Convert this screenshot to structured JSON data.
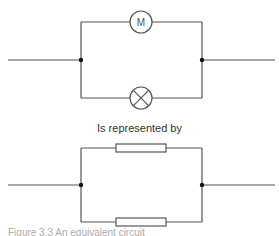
{
  "diagram": {
    "top_circuit": {
      "branches": [
        {
          "component": "motor",
          "symbol_label": "M"
        },
        {
          "component": "lamp",
          "symbol_label": ""
        }
      ]
    },
    "transition_text": "Is represented by",
    "bottom_circuit": {
      "branches": [
        {
          "component": "resistor"
        },
        {
          "component": "resistor"
        }
      ]
    },
    "caption": "Figure 3.3 An equivalent circuit"
  }
}
